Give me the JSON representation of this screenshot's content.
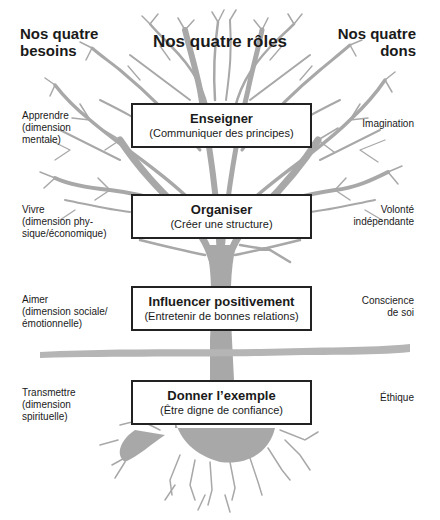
{
  "headings": {
    "left": "Nos quatre besoins",
    "left_line1": "Nos quatre",
    "left_line2": "besoins",
    "center": "Nos quatre rôles",
    "right_line1": "Nos quatre",
    "right_line2": "dons"
  },
  "rows": [
    {
      "need": [
        "Apprendre",
        "(dimension",
        "mentale)"
      ],
      "role_title": "Enseigner",
      "role_subtitle": "(Communiquer des principes)",
      "gift": [
        "Imagination"
      ]
    },
    {
      "need": [
        "Vivre",
        "(dimension phy-",
        "sique/économique)"
      ],
      "role_title": "Organiser",
      "role_subtitle": "(Créer une structure)",
      "gift": [
        "Volonté",
        "indépendante"
      ]
    },
    {
      "need": [
        "Aimer",
        "(dimension sociale/",
        "émotionnelle)"
      ],
      "role_title": "Influencer positivement",
      "role_subtitle": "(Entretenir de bonnes relations)",
      "gift": [
        "Conscience",
        "de soi"
      ]
    },
    {
      "need": [
        "Transmettre",
        "(dimension",
        "spirituelle)"
      ],
      "role_title": "Donner l’exemple",
      "role_subtitle": "(Être digne de confiance)",
      "gift": [
        "Éthique"
      ]
    }
  ],
  "colors": {
    "tree": "#a8a8a8",
    "text": "#1a1a1a",
    "box_border": "#222222"
  }
}
